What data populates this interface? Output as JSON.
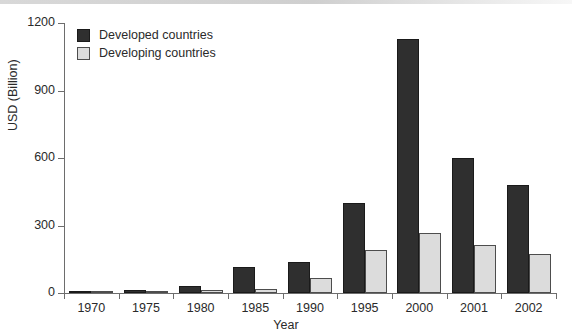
{
  "chart_data": {
    "type": "bar",
    "title": "",
    "xlabel": "Year",
    "ylabel": "USD (Billion)",
    "categories": [
      "1970",
      "1975",
      "1980",
      "1985",
      "1990",
      "1995",
      "2000",
      "2001",
      "2002"
    ],
    "series": [
      {
        "name": "Developed countries",
        "color": "#2f2f2f",
        "values": [
          5,
          14,
          32,
          115,
          140,
          400,
          1130,
          600,
          480
        ]
      },
      {
        "name": "Developing countries",
        "color": "#dcdcdc",
        "values": [
          2,
          5,
          15,
          18,
          68,
          190,
          265,
          215,
          175
        ]
      }
    ],
    "ylim": [
      0,
      1200
    ],
    "yticks": [
      0,
      300,
      600,
      900,
      1200
    ],
    "ytick_labels": [
      "0",
      "300",
      "600",
      "900",
      "1200"
    ],
    "grid": false,
    "legend_position": "top-left",
    "legend_entries": [
      "Developed countries",
      "Developing countries"
    ]
  },
  "axis": {
    "y_title": "USD (Billion)",
    "x_title": "Year"
  }
}
